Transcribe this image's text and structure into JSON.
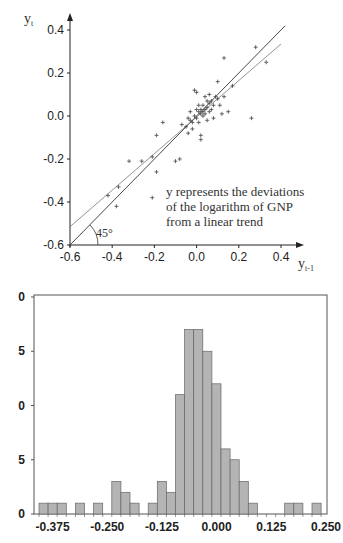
{
  "chart_data": [
    {
      "type": "scatter",
      "title": "",
      "xlabel": "y_{t-1}",
      "ylabel": "y_t",
      "xlabel_main": "y",
      "xlabel_sub": "t-1",
      "ylabel_main": "y",
      "ylabel_sub": "t",
      "xlim": [
        -0.6,
        0.4
      ],
      "ylim": [
        -0.6,
        0.4
      ],
      "xticks": [
        "-0.6",
        "-0.4",
        "-0.2",
        "0.0",
        "0.2",
        "0.4"
      ],
      "yticks": [
        "0.4",
        "0.2",
        "0.0",
        "-0.2",
        "-0.4",
        "-0.6"
      ],
      "grid": false,
      "annotation_lines": [
        "y represents the deviations",
        "of the logarithm of GNP",
        "from a linear trend"
      ],
      "angle_label": "45°",
      "series": [
        {
          "name": "observations",
          "marker": "+",
          "points": [
            [
              -0.42,
              -0.37
            ],
            [
              -0.38,
              -0.42
            ],
            [
              -0.37,
              -0.33
            ],
            [
              -0.32,
              -0.21
            ],
            [
              -0.26,
              -0.21
            ],
            [
              -0.21,
              -0.19
            ],
            [
              -0.21,
              -0.38
            ],
            [
              -0.19,
              -0.26
            ],
            [
              -0.19,
              -0.09
            ],
            [
              -0.16,
              -0.03
            ],
            [
              -0.1,
              -0.21
            ],
            [
              -0.08,
              -0.2
            ],
            [
              -0.07,
              -0.04
            ],
            [
              -0.05,
              -0.05
            ],
            [
              -0.04,
              -0.08
            ],
            [
              -0.03,
              -0.02
            ],
            [
              -0.03,
              0.02
            ],
            [
              -0.02,
              -0.06
            ],
            [
              -0.01,
              0.12
            ],
            [
              0.0,
              0.11
            ],
            [
              0.0,
              -0.01
            ],
            [
              0.01,
              0.02
            ],
            [
              0.01,
              -0.03
            ],
            [
              0.02,
              0.03
            ],
            [
              0.02,
              -0.09
            ],
            [
              0.02,
              -0.11
            ],
            [
              0.03,
              0.0
            ],
            [
              0.03,
              0.05
            ],
            [
              0.04,
              0.01
            ],
            [
              0.04,
              0.09
            ],
            [
              0.05,
              0.04
            ],
            [
              0.05,
              -0.02
            ],
            [
              0.06,
              0.06
            ],
            [
              0.06,
              0.1
            ],
            [
              0.07,
              0.03
            ],
            [
              0.07,
              0.07
            ],
            [
              0.08,
              0.05
            ],
            [
              0.08,
              -0.01
            ],
            [
              0.09,
              0.09
            ],
            [
              0.1,
              0.16
            ],
            [
              0.1,
              0.08
            ],
            [
              0.11,
              0.05
            ],
            [
              0.12,
              0.01
            ],
            [
              0.13,
              0.09
            ],
            [
              0.13,
              0.27
            ],
            [
              0.15,
              0.02
            ],
            [
              0.17,
              0.14
            ],
            [
              0.26,
              -0.01
            ],
            [
              0.28,
              0.32
            ],
            [
              0.33,
              0.25
            ],
            [
              -0.01,
              0.0
            ],
            [
              0.0,
              0.03
            ],
            [
              0.02,
              0.01
            ],
            [
              0.03,
              0.02
            ],
            [
              -0.02,
              -0.03
            ],
            [
              0.01,
              0.05
            ],
            [
              0.04,
              0.03
            ],
            [
              0.05,
              0.07
            ],
            [
              -0.04,
              -0.01
            ],
            [
              0.06,
              0.02
            ]
          ]
        },
        {
          "name": "45° line",
          "type": "line",
          "slope": 1.0,
          "intercept": 0.0
        },
        {
          "name": "regression line",
          "type": "line",
          "slope": 0.85,
          "intercept": -0.005
        }
      ]
    },
    {
      "type": "bar",
      "subtype": "histogram",
      "title": "",
      "xlabel": "",
      "ylabel": "",
      "xticks": [
        "-0.375",
        "-0.250",
        "-0.125",
        "0.000",
        "0.125",
        "0.250"
      ],
      "yticks_visible": [
        "0",
        "5",
        "0",
        "5",
        "0"
      ],
      "yticks_inferred": [
        20,
        15,
        10,
        5,
        0
      ],
      "ylim": [
        0,
        20
      ],
      "bin_width": 0.0208,
      "bin_start": -0.406,
      "values": [
        1,
        1,
        1,
        0,
        1,
        0,
        1,
        0,
        3,
        2,
        1,
        0,
        1,
        3,
        2,
        11,
        17,
        17,
        15,
        12,
        6,
        5,
        3,
        1,
        0,
        0,
        0,
        1,
        1,
        0,
        1
      ],
      "bar_color": "#b4b4b4",
      "grid": false
    }
  ]
}
